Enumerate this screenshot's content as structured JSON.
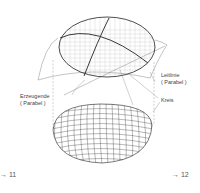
{
  "diagram": {
    "labels": {
      "leitlinie_line1": "Leitlinie",
      "leitlinie_line2": "( Parabel )",
      "erzeugende_line1": "Erzeugende",
      "erzeugende_line2": "( Parabel )",
      "kreis": "Kreis"
    },
    "page_refs": {
      "left": "→ 11",
      "right": "→ 12"
    },
    "colors": {
      "line": "#222222",
      "grid": "#999999",
      "construction": "#777777",
      "background": "#ffffff"
    }
  }
}
